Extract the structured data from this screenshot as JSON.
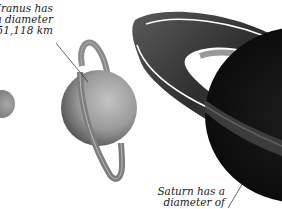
{
  "figure": {
    "uranus": {
      "name": "Uranus",
      "label_lines": [
        "Uranus has",
        "a diameter",
        "of 51,118 km"
      ],
      "diameter_km": "51,118"
    },
    "saturn": {
      "name": "Saturn",
      "label_lines": [
        "Saturn has a",
        "diameter of"
      ]
    },
    "partial_planet_left": {
      "name": "partial planet (cropped at left edge)"
    }
  }
}
